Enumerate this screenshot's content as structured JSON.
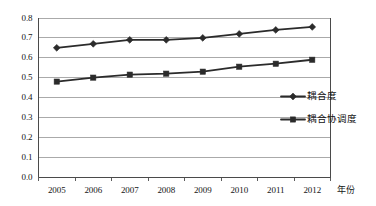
{
  "top_scan_line": {
    "text": "图 3  耦合度与耦合协调度变化趋势"
  },
  "chart_data": {
    "type": "line",
    "title": "",
    "xlabel": "年份",
    "ylabel": "",
    "categories": [
      "2005",
      "2006",
      "2007",
      "2008",
      "2009",
      "2010",
      "2011",
      "2012"
    ],
    "ylim": [
      0.0,
      0.8
    ],
    "ytick_step": 0.1,
    "yticks": [
      "0.0",
      "0.1",
      "0.2",
      "0.3",
      "0.4",
      "0.5",
      "0.6",
      "0.7",
      "0.8"
    ],
    "grid": true,
    "grid_axis": "y",
    "legend_position": "center-right",
    "series": [
      {
        "name": "耦合度",
        "marker": "diamond",
        "color": "#2b2b2b",
        "values": [
          0.65,
          0.67,
          0.69,
          0.69,
          0.7,
          0.72,
          0.74,
          0.755
        ]
      },
      {
        "name": "耦合协调度",
        "marker": "square",
        "color": "#2b2b2b",
        "values": [
          0.48,
          0.5,
          0.515,
          0.52,
          0.53,
          0.555,
          0.57,
          0.59
        ]
      }
    ]
  },
  "colors": {
    "axis": "#4a4a4a",
    "grid": "#8d8d8d",
    "series": "#2b2b2b",
    "text": "#151515",
    "background": "#ffffff"
  }
}
